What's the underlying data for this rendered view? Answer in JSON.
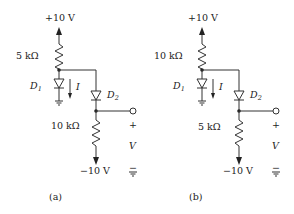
{
  "circuits": [
    {
      "caption": "(a)",
      "supply_top": "+10 V",
      "supply_bottom": "−10 V",
      "r_top": "5 kΩ",
      "r_bottom": "10 kΩ",
      "d1": "D",
      "d1_sub": "1",
      "d2": "D",
      "d2_sub": "2",
      "current": "I",
      "vout": "V",
      "plus": "+",
      "minus": "−"
    },
    {
      "caption": "(b)",
      "supply_top": "+10 V",
      "supply_bottom": "−10 V",
      "r_top": "10 kΩ",
      "r_bottom": "5 kΩ",
      "d1": "D",
      "d1_sub": "1",
      "d2": "D",
      "d2_sub": "2",
      "current": "I",
      "vout": "V",
      "plus": "+",
      "minus": "−"
    }
  ],
  "colors": {
    "ink": "#333333",
    "background": "#ffffff"
  }
}
